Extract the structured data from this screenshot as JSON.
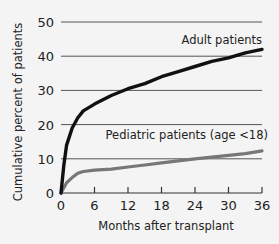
{
  "chart_data": {
    "type": "line",
    "title": "",
    "xlabel": "Months after transplant",
    "ylabel": "Cumulative percent of patients",
    "xlim": [
      0,
      36
    ],
    "ylim": [
      0,
      50
    ],
    "x_ticks": [
      "0",
      "6",
      "12",
      "18",
      "24",
      "30",
      "36"
    ],
    "y_ticks": [
      "0",
      "10",
      "20",
      "30",
      "40",
      "50"
    ],
    "grid": "horizontal",
    "series": [
      {
        "name": "Adult patients",
        "color": "#111111",
        "x": [
          0,
          0.5,
          1,
          2,
          3,
          4,
          6,
          9,
          12,
          15,
          18,
          21,
          24,
          27,
          30,
          33,
          36
        ],
        "values": [
          0,
          8,
          14,
          19,
          22,
          24,
          26,
          28.5,
          30.5,
          32,
          34,
          35.5,
          37,
          38.5,
          39.5,
          41,
          42
        ]
      },
      {
        "name": "Pediatric patients (age <18)",
        "color": "#777777",
        "x": [
          0,
          1,
          2,
          3,
          4,
          6,
          9,
          12,
          15,
          18,
          21,
          24,
          27,
          30,
          33,
          36
        ],
        "values": [
          0,
          3,
          4.5,
          5.8,
          6.3,
          6.7,
          7.0,
          7.6,
          8.2,
          8.8,
          9.4,
          10.0,
          10.5,
          11.0,
          11.5,
          12.3
        ]
      }
    ],
    "annotations": [
      "Adult patients",
      "Pediatric patients (age <18)"
    ]
  }
}
